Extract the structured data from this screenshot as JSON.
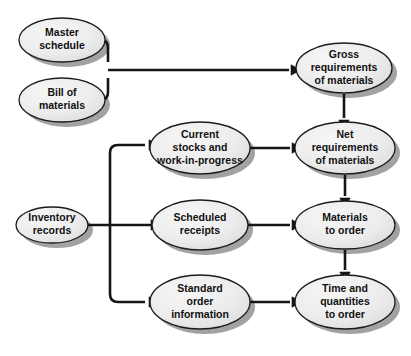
{
  "diagram": {
    "type": "flowchart",
    "background_color": "#ffffff",
    "node_fill_color": "#e9e9e9",
    "node_fill_color_light": "#f4f4f4",
    "node_border_color": "#1c1c1c",
    "node_shadow_color": "#9a9a9a",
    "connector_color": "#151515",
    "text_color": "#111111",
    "nodes": [
      {
        "id": "master-schedule",
        "lines": [
          "Master",
          "schedule"
        ],
        "cx": 62,
        "cy": 40,
        "rx": 43,
        "ry": 22,
        "font_size": 10.5
      },
      {
        "id": "bill-of-materials",
        "lines": [
          "Bill of",
          "materials"
        ],
        "cx": 62,
        "cy": 100,
        "rx": 43,
        "ry": 22,
        "font_size": 10.5
      },
      {
        "id": "inventory-records",
        "lines": [
          "Inventory",
          "records"
        ],
        "cx": 52,
        "cy": 225,
        "rx": 36,
        "ry": 18,
        "font_size": 10.5
      },
      {
        "id": "current-stocks",
        "lines": [
          "Current",
          "stocks and",
          "work-in-progress"
        ],
        "cx": 200,
        "cy": 148,
        "rx": 50,
        "ry": 26,
        "font_size": 10.5
      },
      {
        "id": "scheduled-receipts",
        "lines": [
          "Scheduled",
          "receipts"
        ],
        "cx": 200,
        "cy": 225,
        "rx": 48,
        "ry": 25,
        "font_size": 10.5
      },
      {
        "id": "standard-order-information",
        "lines": [
          "Standard",
          "order",
          "information"
        ],
        "cx": 200,
        "cy": 302,
        "rx": 50,
        "ry": 27,
        "font_size": 10.5
      },
      {
        "id": "gross-requirements",
        "lines": [
          "Gross",
          "requirements",
          "of materials"
        ],
        "cx": 344,
        "cy": 68,
        "rx": 48,
        "ry": 25,
        "font_size": 10.5
      },
      {
        "id": "net-requirements",
        "lines": [
          "Net",
          "requirements",
          "of materials"
        ],
        "cx": 345,
        "cy": 148,
        "rx": 50,
        "ry": 26,
        "font_size": 10.5
      },
      {
        "id": "materials-to-order",
        "lines": [
          "Materials",
          "to order"
        ],
        "cx": 345,
        "cy": 225,
        "rx": 50,
        "ry": 24,
        "font_size": 10.5
      },
      {
        "id": "time-and-quantities",
        "lines": [
          "Time and",
          "quantities",
          "to order"
        ],
        "cx": 345,
        "cy": 302,
        "rx": 50,
        "ry": 27,
        "font_size": 10.5
      }
    ],
    "connectors": [
      {
        "id": "master-schedule-to-junction",
        "from": "master-schedule",
        "to": "junction-top",
        "path": "M 104 40 L 101 40 Q 108 40 108 48 L 108 62"
      },
      {
        "id": "bill-of-materials-to-junction",
        "from": "bill-of-materials",
        "to": "junction-top",
        "path": "M 104 100 L 101 100 Q 108 100 108 92 L 108 78"
      },
      {
        "id": "junction-to-gross-requirements",
        "from": "junction-top",
        "to": "gross-requirements",
        "path": "M 108 70 L 289 70"
      },
      {
        "id": "gross-to-net-requirements",
        "from": "gross-requirements",
        "to": "net-requirements",
        "path": "M 344 94 L 344 118"
      },
      {
        "id": "net-to-materials-to-order",
        "from": "net-requirements",
        "to": "materials-to-order",
        "path": "M 345 175 L 345 196"
      },
      {
        "id": "materials-to-time-quantities",
        "from": "materials-to-order",
        "to": "time-and-quantities",
        "path": "M 345 250 L 345 270"
      },
      {
        "id": "inventory-to-spine",
        "from": "inventory-records",
        "to": "spine",
        "path": "M 87 225 L 175 225"
      },
      {
        "id": "spine-to-current-stocks",
        "from": "spine",
        "to": "current-stocks",
        "path": "M 110 225 L 110 153 Q 110 145 118 145 L 145 145"
      },
      {
        "id": "spine-to-standard-order",
        "from": "spine",
        "to": "standard-order-information",
        "path": "M 110 225 L 110 294 Q 110 302 118 302 L 145 302"
      },
      {
        "id": "current-stocks-to-net",
        "from": "current-stocks",
        "to": "net-requirements",
        "path": "M 250 148 L 290 148"
      },
      {
        "id": "scheduled-receipts-to-materials",
        "from": "scheduled-receipts",
        "to": "materials-to-order",
        "path": "M 248 225 L 290 225"
      },
      {
        "id": "standard-order-to-time-quantities",
        "from": "standard-order-information",
        "to": "time-and-quantities",
        "path": "M 250 302 L 290 302"
      }
    ],
    "arrowheads": [
      {
        "id": "arrow-into-gross-requirements",
        "x": 292,
        "y": 70,
        "dir": "right"
      },
      {
        "id": "arrow-into-net-from-gross",
        "x": 344,
        "y": 121,
        "dir": "down"
      },
      {
        "id": "arrow-into-materials-from-net",
        "x": 345,
        "y": 199,
        "dir": "down"
      },
      {
        "id": "arrow-into-time-from-materials",
        "x": 345,
        "y": 273,
        "dir": "down"
      },
      {
        "id": "arrow-into-current-stocks",
        "x": 150,
        "y": 145,
        "dir": "right"
      },
      {
        "id": "arrow-into-scheduled-receipts",
        "x": 152,
        "y": 225,
        "dir": "right"
      },
      {
        "id": "arrow-into-standard-order",
        "x": 150,
        "y": 302,
        "dir": "right"
      },
      {
        "id": "arrow-into-net-from-stocks",
        "x": 293,
        "y": 148,
        "dir": "right"
      },
      {
        "id": "arrow-into-materials-from-receipts",
        "x": 293,
        "y": 225,
        "dir": "right"
      },
      {
        "id": "arrow-into-time-from-standard",
        "x": 293,
        "y": 302,
        "dir": "right"
      }
    ]
  }
}
